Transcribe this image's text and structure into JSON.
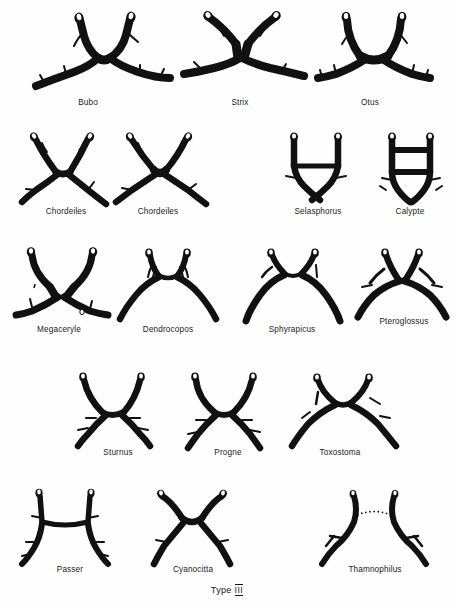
{
  "plate": {
    "caption_prefix": "Type",
    "caption_numeral": "III",
    "caption_full": "Type III",
    "background_color": "#ffffff",
    "ink_color": "#111111",
    "rows": 5,
    "specimen_count": 18
  },
  "figures": [
    {
      "id": "bubo",
      "label": "Bubo",
      "row": 1,
      "shape": "x-fork-wide"
    },
    {
      "id": "strix",
      "label": "Strix",
      "row": 1,
      "shape": "x-fork-wide"
    },
    {
      "id": "otus",
      "label": "Otus",
      "row": 1,
      "shape": "x-fork-narrow"
    },
    {
      "id": "chordeiles-1",
      "label": "Chordeiles",
      "row": 2,
      "shape": "x-fork-narrow"
    },
    {
      "id": "chordeiles-2",
      "label": "Chordeiles",
      "row": 2,
      "shape": "x-fork-narrow"
    },
    {
      "id": "selasphorus",
      "label": "Selasphorus",
      "row": 2,
      "shape": "h-bar"
    },
    {
      "id": "calypte",
      "label": "Calypte",
      "row": 2,
      "shape": "box-bar"
    },
    {
      "id": "megaceryle",
      "label": "Megaceryle",
      "row": 3,
      "shape": "x-fork-wide"
    },
    {
      "id": "dendrocopos",
      "label": "Dendrocopos",
      "row": 3,
      "shape": "arch"
    },
    {
      "id": "sphyrapicus",
      "label": "Sphyrapicus",
      "row": 3,
      "shape": "arch"
    },
    {
      "id": "pteroglossus",
      "label": "Pteroglossus",
      "row": 3,
      "shape": "arch-branched"
    },
    {
      "id": "sturnus",
      "label": "Sturnus",
      "row": 4,
      "shape": "x-fork-narrow"
    },
    {
      "id": "progne",
      "label": "Progne",
      "row": 4,
      "shape": "x-fork-narrow"
    },
    {
      "id": "toxostoma",
      "label": "Toxostoma",
      "row": 4,
      "shape": "arch-branched"
    },
    {
      "id": "passer",
      "label": "Passer",
      "row": 5,
      "shape": "h-bar"
    },
    {
      "id": "cyanocitta",
      "label": "Cyanocitta",
      "row": 5,
      "shape": "x-fork-narrow"
    },
    {
      "id": "thamnophilus",
      "label": "Thamnophilus",
      "row": 5,
      "shape": "split-dotted"
    }
  ]
}
